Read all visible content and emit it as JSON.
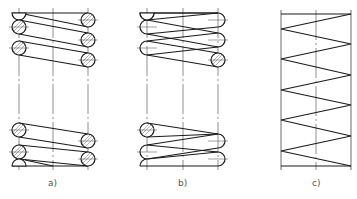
{
  "figure": {
    "panels": [
      {
        "id": "a",
        "label": "a)",
        "style": "full section (wire cross-sections shown as hatched circles)"
      },
      {
        "id": "b",
        "label": "b)",
        "style": "outline view (coil loops with one end section)"
      },
      {
        "id": "c",
        "label": "c)",
        "style": "simplified schematic (zigzag line)"
      }
    ]
  },
  "colors": {
    "line": "#1a1a1a",
    "centerline": "#444444",
    "label": "#555555",
    "background": "#ffffff"
  }
}
